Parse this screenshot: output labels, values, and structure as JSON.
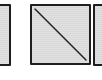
{
  "panels": [
    {
      "id": "left",
      "state": "empty",
      "partially_visible": true,
      "fill_color": "#d9d9d9",
      "border_color": "#1e1e1e"
    },
    {
      "id": "center",
      "state": "crossed",
      "icon": "diagonal-slash-icon",
      "partially_visible": false,
      "fill_color": "#d9d9d9",
      "border_color": "#1e1e1e",
      "line_color": "#1e1e1e"
    },
    {
      "id": "right",
      "state": "empty",
      "partially_visible": true,
      "fill_color": "#d9d9d9",
      "border_color": "#1e1e1e"
    }
  ]
}
